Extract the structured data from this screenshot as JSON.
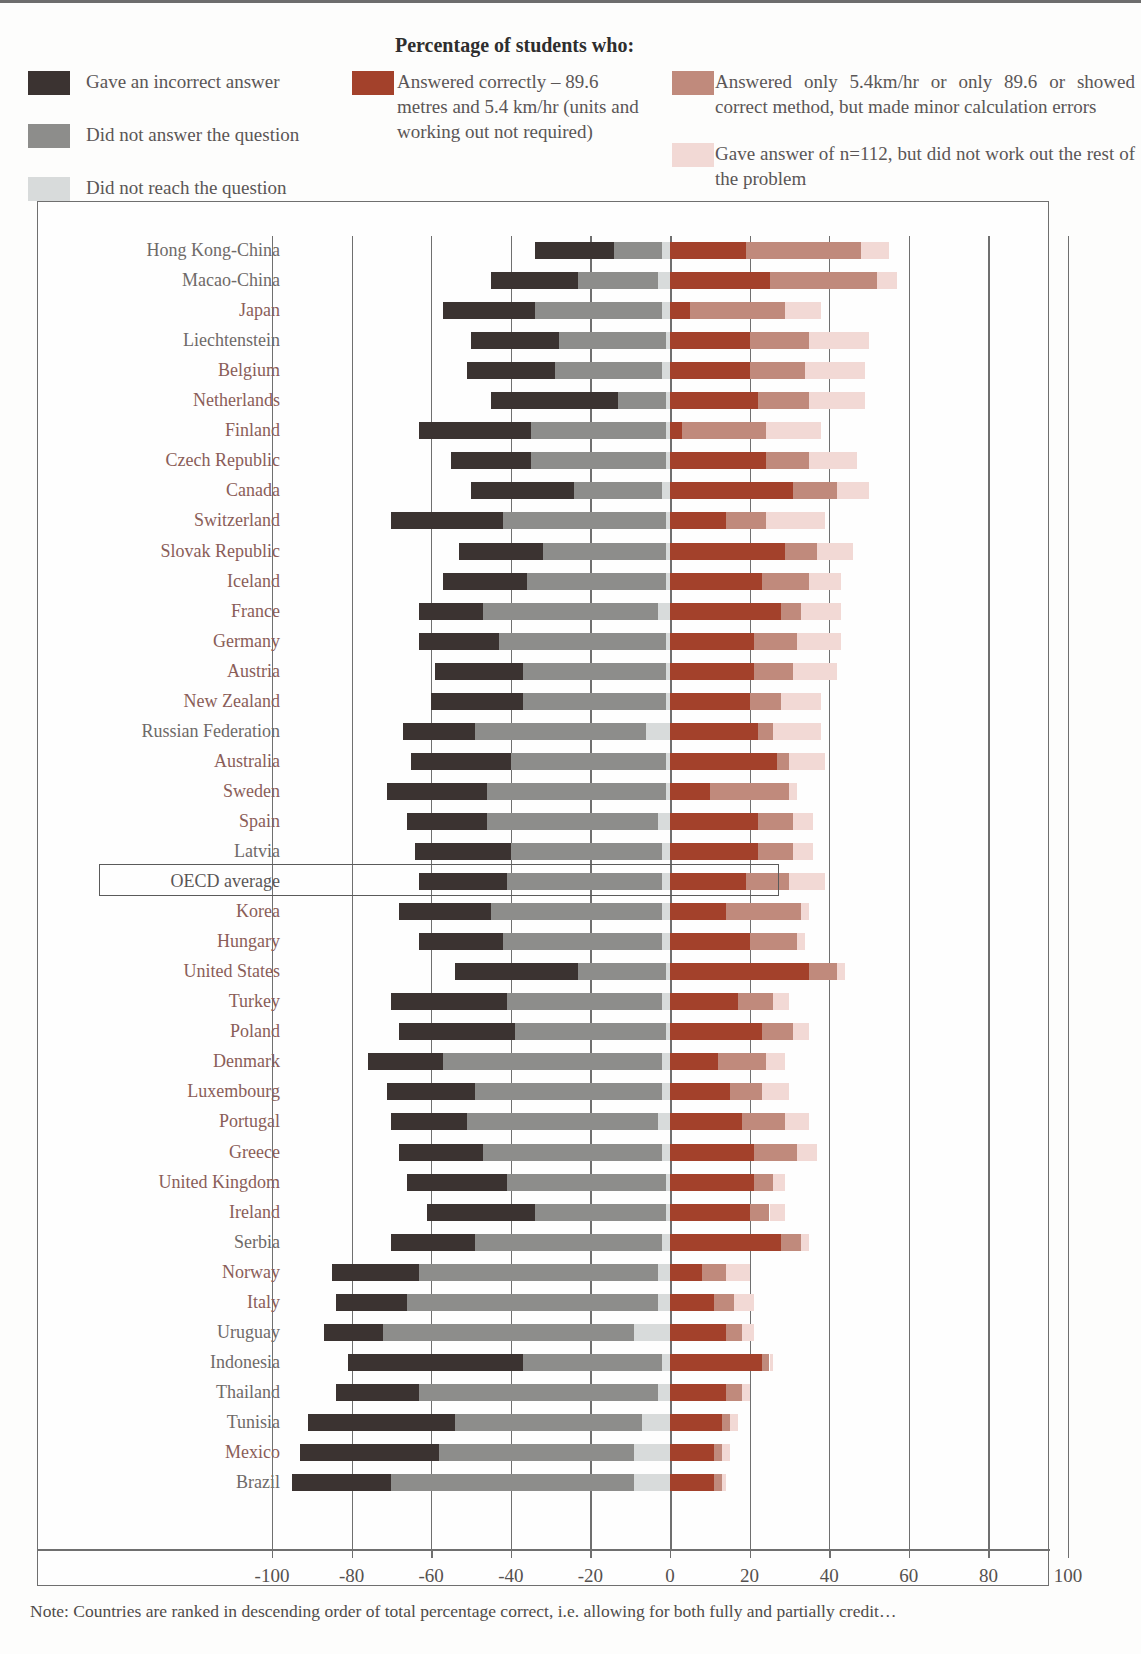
{
  "legend": {
    "title": "Percentage of students who:",
    "items": [
      {
        "key": "incorrect",
        "label": "Gave an incorrect answer",
        "color": "#3b3331"
      },
      {
        "key": "no_answer",
        "label": "Did not answer the question",
        "color": "#8d8d8b"
      },
      {
        "key": "not_reached",
        "label": "Did not reach the question",
        "color": "#d8dbdb"
      },
      {
        "key": "correct",
        "label": "Answered correctly – 89.6 metres and 5.4 km/hr (units and working out not required)",
        "color": "#a3412b"
      },
      {
        "key": "partial",
        "label": "Answered only 5.4km/hr or only 89.6 or showed correct method, but made minor calculation errors",
        "color": "#c08a7c"
      },
      {
        "key": "n112",
        "label": "Gave answer of n=112, but did not work out the rest of the problem",
        "color": "#f2d9d5"
      }
    ]
  },
  "axis": {
    "ticks": [
      -100,
      -80,
      -60,
      -40,
      -20,
      0,
      20,
      40,
      60,
      80,
      100
    ],
    "tick_labels": [
      "-100",
      "-80",
      "-60",
      "-40",
      "-20",
      "0",
      "20",
      "40",
      "60",
      "80",
      "100"
    ],
    "min": -100,
    "max": 100
  },
  "highlight": {
    "row": "OECD average",
    "label": "OECD average"
  },
  "note": "Note: Countries are ranked in descending order of total percentage correct, i.e. allowing for both fully and partially credit…",
  "chart_data": {
    "type": "bar",
    "subtype": "diverging-stacked-horizontal",
    "title": "Percentage of students who:",
    "xlabel": "",
    "ylabel": "",
    "xlim": [
      -100,
      100
    ],
    "grid": true,
    "legend_position": "top",
    "negative_series": [
      "incorrect",
      "no_answer",
      "not_reached"
    ],
    "positive_series": [
      "correct",
      "partial",
      "n112"
    ],
    "series_labels": {
      "incorrect": "Gave an incorrect answer",
      "no_answer": "Did not answer the question",
      "not_reached": "Did not reach the question",
      "correct": "Answered correctly – 89.6 metres and 5.4 km/hr (units and working out not required)",
      "partial": "Answered only 5.4km/hr or only 89.6 or showed correct method, but made minor calculation errors",
      "n112": "Gave answer of n=112, but did not work out the rest of the problem"
    },
    "colors": {
      "incorrect": "#3b3331",
      "no_answer": "#8d8d8b",
      "not_reached": "#d8dbdb",
      "correct": "#a3412b",
      "partial": "#c08a7c",
      "n112": "#f2d9d5"
    },
    "categories": [
      "Hong Kong-China",
      "Macao-China",
      "Japan",
      "Liechtenstein",
      "Belgium",
      "Netherlands",
      "Finland",
      "Czech Republic",
      "Canada",
      "Switzerland",
      "Slovak Republic",
      "Iceland",
      "France",
      "Germany",
      "Austria",
      "New Zealand",
      "Russian Federation",
      "Australia",
      "Sweden",
      "Spain",
      "Latvia",
      "OECD average",
      "Korea",
      "Hungary",
      "United States",
      "Turkey",
      "Poland",
      "Denmark",
      "Luxembourg",
      "Portugal",
      "Greece",
      "United Kingdom",
      "Ireland",
      "Serbia",
      "Norway",
      "Italy",
      "Uruguay",
      "Indonesia",
      "Thailand",
      "Tunisia",
      "Mexico",
      "Brazil"
    ],
    "oecd_member": [
      false,
      false,
      true,
      false,
      true,
      true,
      true,
      true,
      true,
      true,
      true,
      true,
      true,
      true,
      true,
      true,
      false,
      true,
      true,
      true,
      false,
      null,
      true,
      true,
      true,
      true,
      true,
      true,
      true,
      true,
      true,
      true,
      true,
      false,
      true,
      true,
      false,
      false,
      false,
      false,
      true,
      false
    ],
    "rows": [
      {
        "category": "Hong Kong-China",
        "incorrect": 20,
        "no_answer": 12,
        "not_reached": 2,
        "correct": 19,
        "partial": 29,
        "n112": 7
      },
      {
        "category": "Macao-China",
        "incorrect": 22,
        "no_answer": 20,
        "not_reached": 3,
        "correct": 25,
        "partial": 27,
        "n112": 5
      },
      {
        "category": "Japan",
        "incorrect": 23,
        "no_answer": 32,
        "not_reached": 2,
        "correct": 5,
        "partial": 24,
        "n112": 9
      },
      {
        "category": "Liechtenstein",
        "incorrect": 22,
        "no_answer": 27,
        "not_reached": 1,
        "correct": 20,
        "partial": 15,
        "n112": 15
      },
      {
        "category": "Belgium",
        "incorrect": 22,
        "no_answer": 27,
        "not_reached": 2,
        "correct": 20,
        "partial": 14,
        "n112": 15
      },
      {
        "category": "Netherlands",
        "incorrect": 32,
        "no_answer": 12,
        "not_reached": 1,
        "correct": 22,
        "partial": 13,
        "n112": 14
      },
      {
        "category": "Finland",
        "incorrect": 28,
        "no_answer": 34,
        "not_reached": 1,
        "correct": 3,
        "partial": 21,
        "n112": 14
      },
      {
        "category": "Czech Republic",
        "incorrect": 20,
        "no_answer": 34,
        "not_reached": 1,
        "correct": 24,
        "partial": 11,
        "n112": 12
      },
      {
        "category": "Canada",
        "incorrect": 26,
        "no_answer": 22,
        "not_reached": 2,
        "correct": 31,
        "partial": 11,
        "n112": 8
      },
      {
        "category": "Switzerland",
        "incorrect": 28,
        "no_answer": 41,
        "not_reached": 1,
        "correct": 14,
        "partial": 10,
        "n112": 15
      },
      {
        "category": "Slovak Republic",
        "incorrect": 21,
        "no_answer": 31,
        "not_reached": 1,
        "correct": 29,
        "partial": 8,
        "n112": 9
      },
      {
        "category": "Iceland",
        "incorrect": 21,
        "no_answer": 35,
        "not_reached": 1,
        "correct": 23,
        "partial": 12,
        "n112": 8
      },
      {
        "category": "France",
        "incorrect": 16,
        "no_answer": 44,
        "not_reached": 3,
        "correct": 28,
        "partial": 5,
        "n112": 10
      },
      {
        "category": "Germany",
        "incorrect": 20,
        "no_answer": 42,
        "not_reached": 1,
        "correct": 21,
        "partial": 11,
        "n112": 11
      },
      {
        "category": "Austria",
        "incorrect": 22,
        "no_answer": 36,
        "not_reached": 1,
        "correct": 21,
        "partial": 10,
        "n112": 11
      },
      {
        "category": "New Zealand",
        "incorrect": 23,
        "no_answer": 36,
        "not_reached": 1,
        "correct": 20,
        "partial": 8,
        "n112": 10
      },
      {
        "category": "Russian Federation",
        "incorrect": 18,
        "no_answer": 43,
        "not_reached": 6,
        "correct": 22,
        "partial": 4,
        "n112": 12
      },
      {
        "category": "Australia",
        "incorrect": 25,
        "no_answer": 39,
        "not_reached": 1,
        "correct": 27,
        "partial": 3,
        "n112": 9
      },
      {
        "category": "Sweden",
        "incorrect": 25,
        "no_answer": 45,
        "not_reached": 1,
        "correct": 10,
        "partial": 20,
        "n112": 2
      },
      {
        "category": "Spain",
        "incorrect": 20,
        "no_answer": 43,
        "not_reached": 3,
        "correct": 22,
        "partial": 9,
        "n112": 5
      },
      {
        "category": "Latvia",
        "incorrect": 24,
        "no_answer": 38,
        "not_reached": 2,
        "correct": 22,
        "partial": 9,
        "n112": 5
      },
      {
        "category": "OECD average",
        "incorrect": 22,
        "no_answer": 39,
        "not_reached": 2,
        "correct": 19,
        "partial": 11,
        "n112": 9
      },
      {
        "category": "Korea",
        "incorrect": 23,
        "no_answer": 43,
        "not_reached": 2,
        "correct": 14,
        "partial": 19,
        "n112": 2
      },
      {
        "category": "Hungary",
        "incorrect": 21,
        "no_answer": 40,
        "not_reached": 2,
        "correct": 20,
        "partial": 12,
        "n112": 2
      },
      {
        "category": "United States",
        "incorrect": 31,
        "no_answer": 22,
        "not_reached": 1,
        "correct": 35,
        "partial": 7,
        "n112": 2
      },
      {
        "category": "Turkey",
        "incorrect": 29,
        "no_answer": 39,
        "not_reached": 2,
        "correct": 17,
        "partial": 9,
        "n112": 4
      },
      {
        "category": "Poland",
        "incorrect": 29,
        "no_answer": 38,
        "not_reached": 1,
        "correct": 23,
        "partial": 8,
        "n112": 4
      },
      {
        "category": "Denmark",
        "incorrect": 19,
        "no_answer": 55,
        "not_reached": 2,
        "correct": 12,
        "partial": 12,
        "n112": 5
      },
      {
        "category": "Luxembourg",
        "incorrect": 22,
        "no_answer": 47,
        "not_reached": 2,
        "correct": 15,
        "partial": 8,
        "n112": 7
      },
      {
        "category": "Portugal",
        "incorrect": 19,
        "no_answer": 48,
        "not_reached": 3,
        "correct": 18,
        "partial": 11,
        "n112": 6
      },
      {
        "category": "Greece",
        "incorrect": 21,
        "no_answer": 45,
        "not_reached": 2,
        "correct": 21,
        "partial": 11,
        "n112": 5
      },
      {
        "category": "United Kingdom",
        "incorrect": 25,
        "no_answer": 40,
        "not_reached": 1,
        "correct": 21,
        "partial": 5,
        "n112": 3
      },
      {
        "category": "Ireland",
        "incorrect": 27,
        "no_answer": 33,
        "not_reached": 1,
        "correct": 20,
        "partial": 5,
        "n112": 4
      },
      {
        "category": "Serbia",
        "incorrect": 21,
        "no_answer": 47,
        "not_reached": 2,
        "correct": 28,
        "partial": 5,
        "n112": 2
      },
      {
        "category": "Norway",
        "incorrect": 22,
        "no_answer": 60,
        "not_reached": 3,
        "correct": 8,
        "partial": 6,
        "n112": 6
      },
      {
        "category": "Italy",
        "incorrect": 18,
        "no_answer": 63,
        "not_reached": 3,
        "correct": 11,
        "partial": 5,
        "n112": 5
      },
      {
        "category": "Uruguay",
        "incorrect": 15,
        "no_answer": 63,
        "not_reached": 9,
        "correct": 14,
        "partial": 4,
        "n112": 3
      },
      {
        "category": "Indonesia",
        "incorrect": 44,
        "no_answer": 35,
        "not_reached": 2,
        "correct": 23,
        "partial": 2,
        "n112": 1
      },
      {
        "category": "Thailand",
        "incorrect": 21,
        "no_answer": 60,
        "not_reached": 3,
        "correct": 14,
        "partial": 4,
        "n112": 2
      },
      {
        "category": "Tunisia",
        "incorrect": 37,
        "no_answer": 47,
        "not_reached": 7,
        "correct": 13,
        "partial": 2,
        "n112": 2
      },
      {
        "category": "Mexico",
        "incorrect": 35,
        "no_answer": 49,
        "not_reached": 9,
        "correct": 11,
        "partial": 2,
        "n112": 2
      },
      {
        "category": "Brazil",
        "incorrect": 25,
        "no_answer": 61,
        "not_reached": 9,
        "correct": 11,
        "partial": 2,
        "n112": 1
      }
    ]
  }
}
